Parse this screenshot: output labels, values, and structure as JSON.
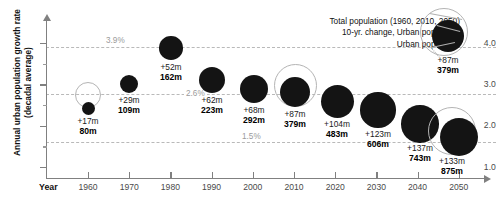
{
  "chart_data": {
    "type": "scatter",
    "title": "",
    "xlabel": "Year",
    "ylabel": "Annual urban population growth rate (decadal average)",
    "ylim": [
      0.6,
      4.35
    ],
    "xlim": [
      1955,
      2055
    ],
    "grid": false,
    "legend_position": "top-right",
    "y_ticks": [
      "4.0",
      "3.0",
      "2.0",
      "1.0"
    ],
    "y_tick_values": [
      4.0,
      3.0,
      2.0,
      1.0
    ],
    "categories": [
      "1960",
      "1970",
      "1980",
      "1990",
      "2000",
      "2010",
      "2020",
      "2030",
      "2040",
      "2050"
    ],
    "series": [
      {
        "name": "Annual urban population growth rate (decadal average)",
        "values": [
          2.42,
          2.87,
          3.75,
          3.16,
          2.86,
          2.75,
          2.38,
          2.08,
          1.73,
          1.44
        ]
      },
      {
        "name": "10-yr. change, Urban population (millions)",
        "values": [
          17,
          29,
          52,
          62,
          68,
          87,
          104,
          123,
          137,
          133
        ]
      },
      {
        "name": "Urban population (millions)",
        "values": [
          80,
          109,
          162,
          223,
          292,
          379,
          483,
          606,
          743,
          875
        ]
      },
      {
        "name": "Total population (millions)",
        "values": [
          null,
          null,
          null,
          null,
          null,
          null,
          null,
          null,
          null,
          null
        ]
      }
    ],
    "points": [
      {
        "year": "1960",
        "change": "+17m",
        "total": "80m",
        "growth": 2.42,
        "cx": 88,
        "cy": 108,
        "r": 6.5,
        "ring": true,
        "ring_cx": 88,
        "ring_cy": 95,
        "ring_r": 13,
        "label_x": 88,
        "label_y": 116
      },
      {
        "year": "1970",
        "change": "+29m",
        "total": "109m",
        "growth": 2.87,
        "cx": 129,
        "cy": 84,
        "r": 9.2,
        "ring": false,
        "ring_cx": 0,
        "ring_cy": 0,
        "ring_r": 0,
        "label_x": 129,
        "label_y": 95
      },
      {
        "year": "1980",
        "change": "+52m",
        "total": "162m",
        "growth": 3.75,
        "cx": 171,
        "cy": 48,
        "r": 11.8,
        "ring": false,
        "ring_cx": 0,
        "ring_cy": 0,
        "ring_r": 0,
        "label_x": 171,
        "label_y": 62
      },
      {
        "year": "1990",
        "change": "+62m",
        "total": "223m",
        "growth": 3.16,
        "cx": 212,
        "cy": 80,
        "r": 13.2,
        "ring": false,
        "ring_cx": 0,
        "ring_cy": 0,
        "ring_r": 0,
        "label_x": 212,
        "label_y": 95
      },
      {
        "year": "2000",
        "change": "+68m",
        "total": "292m",
        "growth": 2.86,
        "cx": 254,
        "cy": 89,
        "r": 14.3,
        "ring": false,
        "ring_cx": 0,
        "ring_cy": 0,
        "ring_r": 0,
        "label_x": 254,
        "label_y": 105
      },
      {
        "year": "2010",
        "change": "+87m",
        "total": "379m",
        "growth": 2.75,
        "cx": 295,
        "cy": 92,
        "r": 15.3,
        "ring": true,
        "ring_cx": 295,
        "ring_cy": 85,
        "ring_r": 21.5,
        "label_x": 295,
        "label_y": 109
      },
      {
        "year": "2020",
        "change": "+104m",
        "total": "483m",
        "growth": 2.38,
        "cx": 337,
        "cy": 101,
        "r": 16.5,
        "ring": false,
        "ring_cx": 0,
        "ring_cy": 0,
        "ring_r": 0,
        "label_x": 337,
        "label_y": 119
      },
      {
        "year": "2030",
        "change": "+123m",
        "total": "606m",
        "growth": 2.08,
        "cx": 378,
        "cy": 110,
        "r": 17.6,
        "ring": false,
        "ring_cx": 0,
        "ring_cy": 0,
        "ring_r": 0,
        "label_x": 378,
        "label_y": 129
      },
      {
        "year": "2040",
        "change": "+137m",
        "total": "743m",
        "growth": 1.73,
        "cx": 420,
        "cy": 124,
        "r": 18.7,
        "ring": false,
        "ring_cx": 0,
        "ring_cy": 0,
        "ring_r": 0,
        "label_x": 420,
        "label_y": 143
      },
      {
        "year": "2050",
        "change": "+133m",
        "total": "875m",
        "growth": 1.44,
        "cx": 459,
        "cy": 137,
        "r": 19.4,
        "ring": true,
        "ring_cx": 452,
        "ring_cy": 131,
        "ring_r": 24,
        "label_x": 452,
        "label_y": 156
      }
    ],
    "reference_lines": [
      {
        "label": "3.9%",
        "value": 3.9,
        "y": 47,
        "x_start": 46,
        "x_end": 496,
        "label_x": 104,
        "label_y": 36
      },
      {
        "label": "2.6%",
        "value": 2.6,
        "y": 94,
        "x_start": 46,
        "x_end": 496,
        "label_x": 184,
        "label_y": 89
      },
      {
        "label": "1.5%",
        "value": 1.5,
        "y": 142,
        "x_start": 46,
        "x_end": 496,
        "label_x": 240,
        "label_y": 132
      }
    ],
    "annotations": [
      "Total population (1960, 2010, 2050)",
      "10-yr. change, Urban population",
      "Urban population"
    ],
    "legend_sample": {
      "change": "+87m",
      "total": "379m",
      "ring_cx": 444,
      "ring_cy": 32,
      "ring_r": 24,
      "cx": 448,
      "cy": 36,
      "r": 16
    }
  },
  "colors": {
    "disc": "#141414",
    "ring": "#b4b4b4",
    "axis": "#808080",
    "refline": "#b9b9b9",
    "reflabel": "#9b9b9b",
    "text": "#111111",
    "background": "#ffffff"
  }
}
